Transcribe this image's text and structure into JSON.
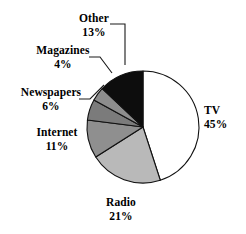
{
  "chart_data": {
    "type": "pie",
    "title": "",
    "subtitle": "",
    "xlabel": "",
    "ylabel": "",
    "grid": false,
    "legend_position": "none",
    "label_format": "name + percent",
    "start_angle_deg": 0,
    "direction": "clockwise",
    "categories": [
      "TV",
      "Radio",
      "Internet",
      "Newspapers",
      "Magazines",
      "Other"
    ],
    "values": [
      45,
      21,
      11,
      6,
      4,
      13
    ],
    "units": "%",
    "total": 100,
    "slices": [
      {
        "name": "TV",
        "label": "TV",
        "value": 45,
        "value_label": "45%",
        "color": "#ffffff",
        "stroke": "#111111",
        "start_deg": 0,
        "end_deg": 162
      },
      {
        "name": "Radio",
        "label": "Radio",
        "value": 21,
        "value_label": "21%",
        "color": "#b9b9b9",
        "stroke": "#111111",
        "start_deg": 162,
        "end_deg": 237.6
      },
      {
        "name": "Internet",
        "label": "Internet",
        "value": 11,
        "value_label": "11%",
        "color": "#8f8f8f",
        "stroke": "#111111",
        "start_deg": 237.6,
        "end_deg": 277.2
      },
      {
        "name": "Newspapers",
        "label": "Newspapers",
        "value": 6,
        "value_label": "6%",
        "color": "#7b7b7b",
        "stroke": "#111111",
        "start_deg": 277.2,
        "end_deg": 298.8
      },
      {
        "name": "Magazines",
        "label": "Magazines",
        "value": 4,
        "value_label": "4%",
        "color": "#8d8d8d",
        "stroke": "#111111",
        "start_deg": 298.8,
        "end_deg": 313.2
      },
      {
        "name": "Other",
        "label": "Other",
        "value": 13,
        "value_label": "13%",
        "color": "#0d0d0d",
        "stroke": "#111111",
        "start_deg": 313.2,
        "end_deg": 360
      }
    ],
    "geometry": {
      "center_x": 143,
      "center_y": 127,
      "radius": 56
    },
    "colors": {
      "background": "#ffffff",
      "outline": "#111111",
      "text": "#000000",
      "leader_line": "#1a1a1a"
    }
  }
}
